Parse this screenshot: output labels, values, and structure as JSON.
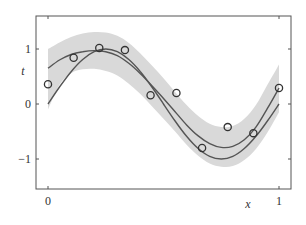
{
  "chart_data": {
    "type": "line",
    "title": "",
    "xlabel": "x",
    "ylabel": "t",
    "xlim": [
      -0.05,
      1.05
    ],
    "ylim": [
      -1.55,
      1.6
    ],
    "xticks": [
      0,
      1
    ],
    "xtick_labels": [
      "0",
      "1"
    ],
    "yticks": [
      -1,
      0,
      1
    ],
    "ytick_labels": [
      "−1",
      "0",
      "1"
    ],
    "grid": false,
    "legend": null,
    "series": [
      {
        "name": "observations",
        "kind": "scatter",
        "marker": "open-circle",
        "x": [
          0.0,
          0.111,
          0.222,
          0.333,
          0.444,
          0.556,
          0.667,
          0.778,
          0.889,
          1.0
        ],
        "y": [
          0.36,
          0.84,
          1.02,
          0.98,
          0.16,
          0.2,
          -0.8,
          -0.42,
          -0.53,
          0.29
        ]
      },
      {
        "name": "true function sin(2πx)",
        "kind": "line",
        "x": [
          0,
          0.05,
          0.1,
          0.15,
          0.2,
          0.25,
          0.3,
          0.35,
          0.4,
          0.45,
          0.5,
          0.55,
          0.6,
          0.65,
          0.7,
          0.75,
          0.8,
          0.85,
          0.9,
          0.95,
          1.0
        ],
        "y": [
          0,
          0.309,
          0.588,
          0.809,
          0.951,
          1.0,
          0.951,
          0.809,
          0.588,
          0.309,
          0,
          -0.309,
          -0.588,
          -0.809,
          -0.951,
          -1.0,
          -0.951,
          -0.809,
          -0.588,
          -0.309,
          0
        ]
      },
      {
        "name": "predictive mean",
        "kind": "line",
        "x": [
          0,
          0.05,
          0.1,
          0.15,
          0.2,
          0.25,
          0.3,
          0.35,
          0.4,
          0.45,
          0.5,
          0.55,
          0.6,
          0.65,
          0.7,
          0.75,
          0.8,
          0.85,
          0.9,
          0.95,
          1.0
        ],
        "y": [
          0.65,
          0.8,
          0.9,
          0.95,
          0.97,
          0.95,
          0.88,
          0.74,
          0.55,
          0.33,
          0.1,
          -0.14,
          -0.38,
          -0.58,
          -0.72,
          -0.79,
          -0.77,
          -0.65,
          -0.42,
          -0.08,
          0.29
        ]
      },
      {
        "name": "predictive ±1 std band",
        "kind": "area",
        "x": [
          0,
          0.05,
          0.1,
          0.15,
          0.2,
          0.25,
          0.3,
          0.35,
          0.4,
          0.45,
          0.5,
          0.55,
          0.6,
          0.65,
          0.7,
          0.75,
          0.8,
          0.85,
          0.9,
          0.95,
          1.0
        ],
        "upper": [
          1.0,
          1.12,
          1.22,
          1.28,
          1.31,
          1.3,
          1.24,
          1.11,
          0.92,
          0.7,
          0.47,
          0.22,
          -0.02,
          -0.22,
          -0.36,
          -0.42,
          -0.4,
          -0.27,
          -0.02,
          0.35,
          0.72
        ],
        "lower": [
          -0.1,
          0.35,
          0.56,
          0.63,
          0.64,
          0.6,
          0.52,
          0.37,
          0.18,
          -0.04,
          -0.27,
          -0.5,
          -0.74,
          -0.94,
          -1.08,
          -1.14,
          -1.13,
          -1.02,
          -0.82,
          -0.52,
          -0.15
        ]
      }
    ]
  },
  "colors": {
    "band": "#d9d9d9",
    "curve": "#555555",
    "marker_edge": "#333333",
    "axis": "#555555"
  }
}
